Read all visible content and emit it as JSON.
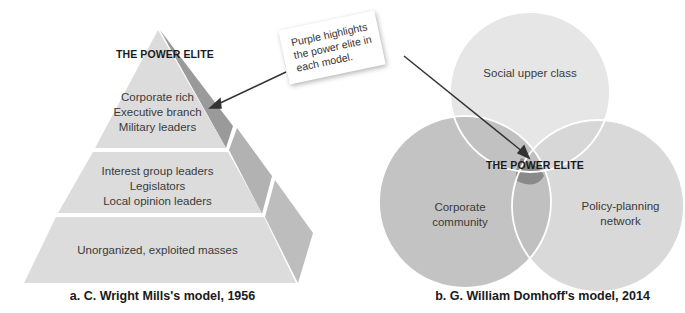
{
  "colors": {
    "pyramid_front": "#dcdcdc",
    "pyramid_side_top": "#9a9a9a",
    "pyramid_side_mid": "#b2b2b2",
    "pyramid_side_bot": "#bdbdbd",
    "venn_top": "#e6e6e6",
    "venn_left": "#bcbcbc",
    "venn_right": "#d6d6d6",
    "power_elite": "#8a8a8a",
    "arrow": "#333333"
  },
  "callout": {
    "text": "Purple highlights the power elite in each model."
  },
  "mills_model": {
    "title": "THE POWER ELITE",
    "tiers": [
      {
        "lines": [
          "Corporate rich",
          "Executive branch",
          "Military leaders"
        ]
      },
      {
        "lines": [
          "Interest group leaders",
          "Legislators",
          "Local opinion leaders"
        ]
      },
      {
        "lines": [
          "Unorganized, exploited masses"
        ]
      }
    ],
    "caption": "a. C. Wright Mills's model, 1956"
  },
  "domhoff_model": {
    "title": "THE POWER ELITE",
    "circles": [
      {
        "label": "Social upper class"
      },
      {
        "label_lines": [
          "Corporate",
          "community"
        ]
      },
      {
        "label_lines": [
          "Policy-planning",
          "network"
        ]
      }
    ],
    "caption": "b. G. William Domhoff's model, 2014"
  }
}
